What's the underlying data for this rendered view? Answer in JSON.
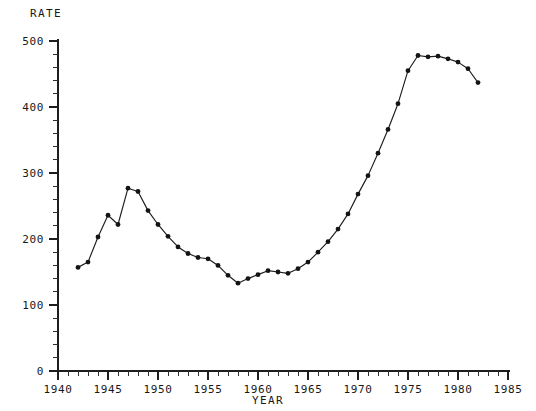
{
  "chart_data": {
    "type": "line",
    "title": "",
    "ylabel": "RATE",
    "xlabel": "YEAR",
    "xlim": [
      1940,
      1985
    ],
    "ylim": [
      0,
      500
    ],
    "grid": false,
    "legend": false,
    "x_major_ticks": [
      1940,
      1945,
      1950,
      1955,
      1960,
      1965,
      1970,
      1975,
      1980,
      1985
    ],
    "x_tick_labels": [
      "1940",
      "1945",
      "1950",
      "1955",
      "1960",
      "1965",
      "1970",
      "1975",
      "1980",
      "1985"
    ],
    "x_minor_step": 1,
    "y_major_ticks": [
      0,
      100,
      200,
      300,
      400,
      500
    ],
    "y_tick_labels": [
      "0",
      "100",
      "200",
      "300",
      "400",
      "500"
    ],
    "y_minor_step": 20,
    "marker": "filled-circle",
    "series": [
      {
        "name": "rate",
        "x": [
          1942,
          1943,
          1944,
          1945,
          1946,
          1947,
          1948,
          1949,
          1950,
          1951,
          1952,
          1953,
          1954,
          1955,
          1956,
          1957,
          1958,
          1959,
          1960,
          1961,
          1962,
          1963,
          1964,
          1965,
          1966,
          1967,
          1968,
          1969,
          1970,
          1971,
          1972,
          1973,
          1974,
          1975,
          1976,
          1977,
          1978,
          1979,
          1980,
          1981,
          1982
        ],
        "y": [
          157,
          165,
          203,
          236,
          222,
          277,
          272,
          243,
          222,
          204,
          188,
          178,
          172,
          170,
          160,
          145,
          133,
          140,
          146,
          152,
          150,
          148,
          155,
          165,
          180,
          196,
          215,
          238,
          268,
          296,
          330,
          366,
          405,
          455,
          478,
          476,
          477,
          473,
          468,
          458,
          437
        ]
      }
    ],
    "annotations": []
  },
  "axes": {
    "y_axis_label": "RATE",
    "x_axis_label": "YEAR"
  }
}
